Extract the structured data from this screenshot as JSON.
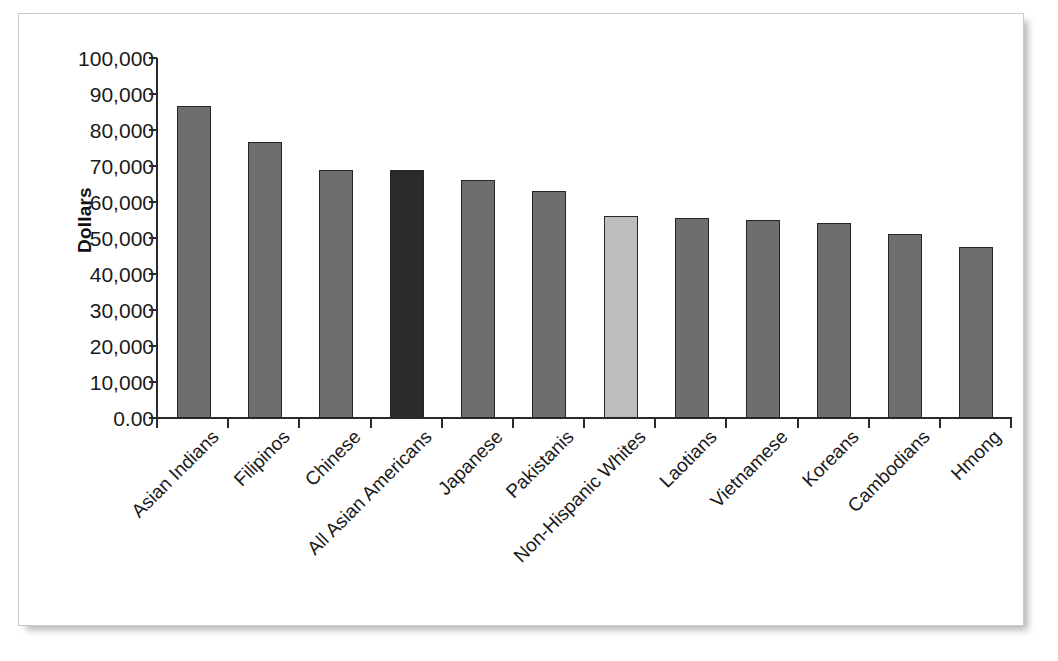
{
  "chart_data": {
    "type": "bar",
    "title": "",
    "subtitle": "",
    "xlabel": "",
    "ylabel": "Dollars",
    "ylim": [
      0,
      100000
    ],
    "grid": false,
    "legend": "none",
    "ytick_labels": [
      "100,000",
      "90,000",
      "80,000",
      "70,000",
      "60,000",
      "50,000",
      "40,000",
      "30,000",
      "20,000",
      "10,000",
      "0.00"
    ],
    "ytick_values": [
      100000,
      90000,
      80000,
      70000,
      60000,
      50000,
      40000,
      30000,
      20000,
      10000,
      0
    ],
    "categories": [
      "Asian Indians",
      "Filipinos",
      "Chinese",
      "All Asian Americans",
      "Japanese",
      "Pakistanis",
      "Non-Hispanic Whites",
      "Laotians",
      "Vietnamese",
      "Koreans",
      "Cambodians",
      "Hmong"
    ],
    "values": [
      86700,
      76600,
      68800,
      68800,
      66000,
      63000,
      56000,
      55500,
      55100,
      54300,
      51200,
      47500
    ],
    "bar_colors": [
      "#6e6e6e",
      "#6e6e6e",
      "#6e6e6e",
      "#2b2b2b",
      "#6e6e6e",
      "#6e6e6e",
      "#bdbdbd",
      "#6e6e6e",
      "#6e6e6e",
      "#6e6e6e",
      "#6e6e6e",
      "#6e6e6e"
    ],
    "colors": {
      "default_bar": "#6e6e6e",
      "highlight_dark": "#2b2b2b",
      "highlight_light": "#bdbdbd",
      "axis": "#2a2a2a",
      "text": "#1a1a1a",
      "background": "#ffffff"
    }
  }
}
